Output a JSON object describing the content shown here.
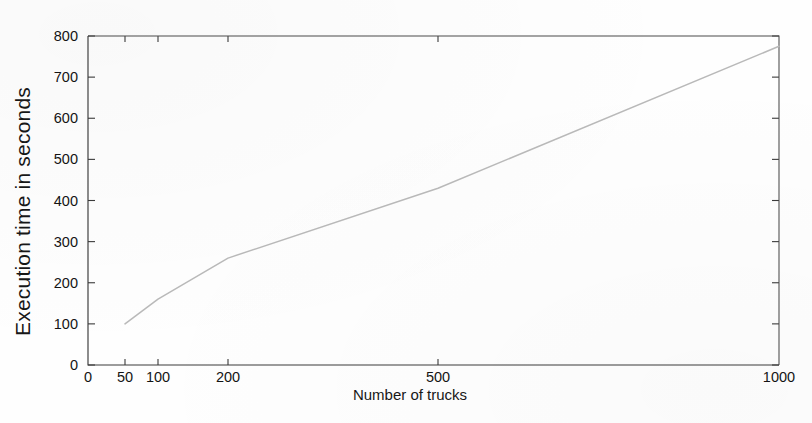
{
  "chart_data": {
    "type": "line",
    "title": "",
    "xlabel": "Number of trucks",
    "ylabel": "Execution time in seconds",
    "xlim": [
      0,
      1000
    ],
    "ylim": [
      0,
      800
    ],
    "grid": false,
    "legend": null,
    "x_tick_labels": [
      "0",
      "50",
      "100",
      "200",
      "500",
      "1000"
    ],
    "x_tick_values": [
      0,
      50,
      100,
      200,
      500,
      1000
    ],
    "x_tick_pixels": [
      88,
      125,
      158,
      228,
      438,
      779
    ],
    "y_tick_labels": [
      "0",
      "100",
      "200",
      "300",
      "400",
      "500",
      "600",
      "700",
      "800"
    ],
    "y_tick_values": [
      0,
      100,
      200,
      300,
      400,
      500,
      600,
      700,
      800
    ],
    "series": [
      {
        "name": "execution time",
        "x": [
          50,
          100,
          200,
          500,
          1000
        ],
        "values": [
          100,
          160,
          260,
          430,
          775
        ]
      }
    ],
    "axis_note": "x-axis uses a compressed non-linear spacing; tick pixel positions given"
  },
  "figure": {
    "background_color": "#fefefe",
    "line_color": "#b9b9b9",
    "axis_color": "#3a3a3a",
    "text_color": "#141414"
  }
}
